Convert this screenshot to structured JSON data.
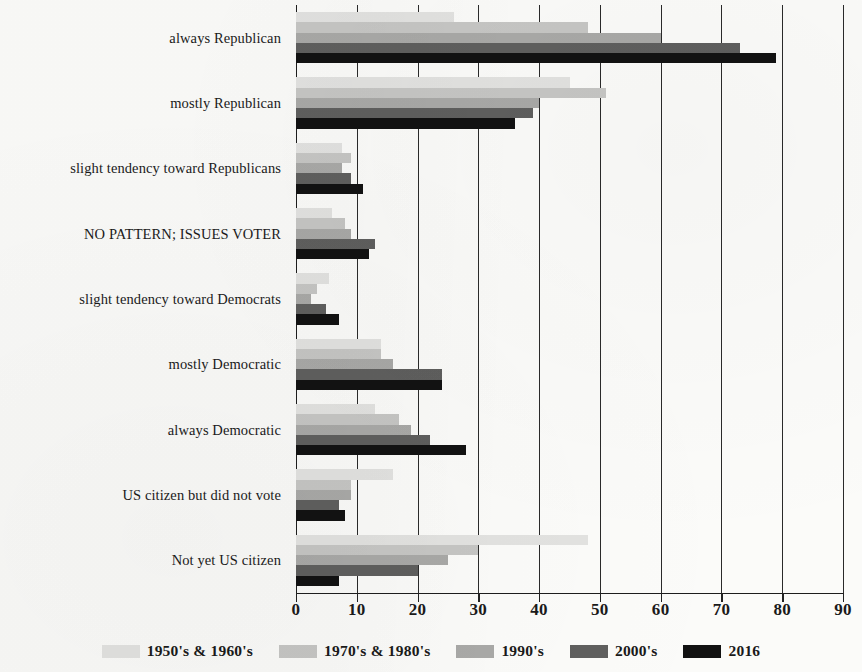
{
  "chart_data": {
    "type": "bar",
    "orientation": "horizontal",
    "title": "",
    "xlabel": "",
    "ylabel": "",
    "xlim": [
      0,
      90
    ],
    "xticks": [
      0,
      10,
      20,
      30,
      40,
      50,
      60,
      70,
      80,
      90
    ],
    "grid": true,
    "legend_position": "bottom",
    "categories": [
      "always Republican",
      "mostly Republican",
      "slight tendency toward Republicans",
      "NO PATTERN; ISSUES VOTER",
      "slight tendency toward Democrats",
      "mostly Democratic",
      "always Democratic",
      "US citizen but did not vote",
      "Not yet US citizen"
    ],
    "series": [
      {
        "name": "1950's & 1960's",
        "color": "#e2e2e0",
        "values": [
          26,
          45,
          7.5,
          6,
          5.5,
          14,
          13,
          16,
          48
        ]
      },
      {
        "name": "1970's & 1980's",
        "color": "#c6c6c4",
        "values": [
          48,
          51,
          9,
          8,
          3.5,
          14,
          17,
          9,
          30
        ]
      },
      {
        "name": "1990's",
        "color": "#a9a9a7",
        "values": [
          60,
          40,
          7.5,
          9,
          2.5,
          16,
          19,
          9,
          25
        ]
      },
      {
        "name": "2000's",
        "color": "#5f5f5e",
        "values": [
          73,
          39,
          9,
          13,
          5,
          24,
          22,
          7,
          20
        ]
      },
      {
        "name": "2016",
        "color": "#121212",
        "values": [
          79,
          36,
          11,
          12,
          7,
          24,
          28,
          8,
          7
        ]
      }
    ]
  },
  "legend": {
    "items": [
      {
        "label": "1950's & 1960's",
        "color": "#e2e2e0"
      },
      {
        "label": "1970's & 1980's",
        "color": "#c6c6c4"
      },
      {
        "label": "1990's",
        "color": "#a9a9a7"
      },
      {
        "label": "2000's",
        "color": "#5f5f5e"
      },
      {
        "label": "2016",
        "color": "#121212"
      }
    ]
  }
}
